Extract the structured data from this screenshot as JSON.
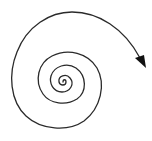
{
  "diagram": {
    "type": "spiral-arrow",
    "background": "#ffffff",
    "stroke_color": "#2a2a2a",
    "stroke_width": 1.3,
    "arrowhead": {
      "shape": "filled-triangle",
      "direction": "down-right",
      "color": "#111111"
    }
  }
}
